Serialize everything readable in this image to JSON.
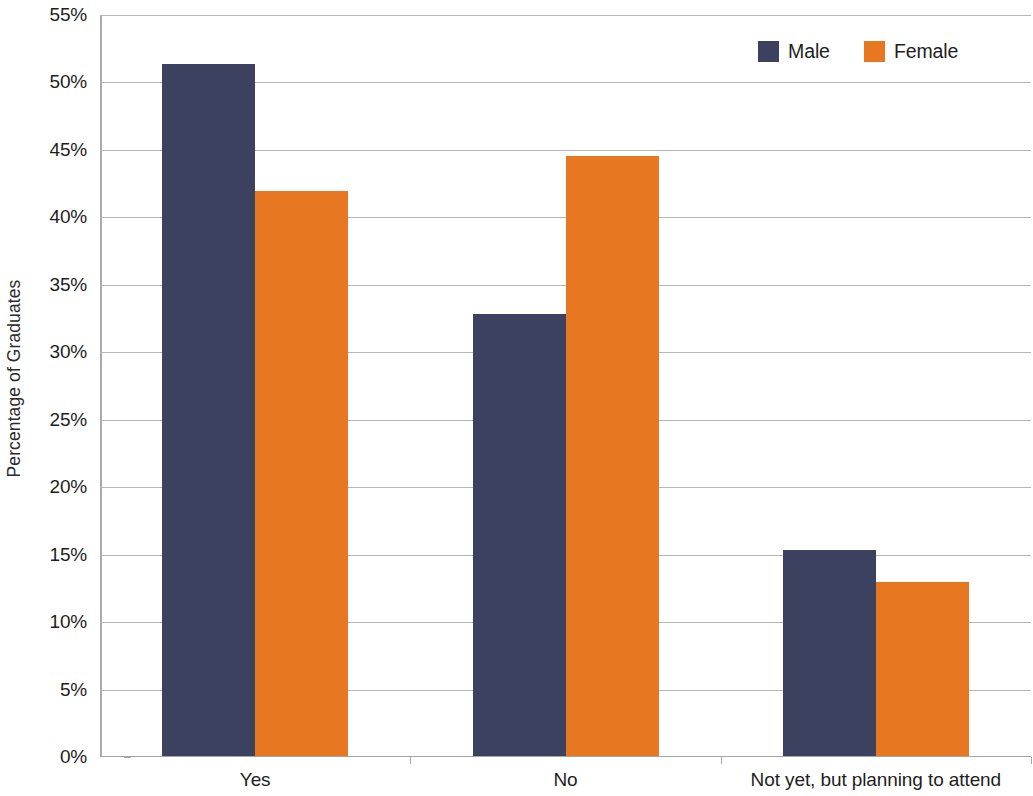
{
  "chart_data": {
    "type": "bar",
    "title": "",
    "subtitle": "",
    "xlabel": "",
    "ylabel": "Percentage of Graduates",
    "categories": [
      "Yes",
      "No",
      "Not yet, but planning to attend"
    ],
    "series": [
      {
        "name": "Male",
        "color": "#3d4160",
        "values": [
          51.3,
          32.8,
          15.3
        ]
      },
      {
        "name": "Female",
        "color": "#e87722",
        "values": [
          41.9,
          44.5,
          12.9
        ]
      }
    ],
    "ylim": [
      0,
      55
    ],
    "ytick_step": 5,
    "ytick_labels": [
      "0%",
      "5%",
      "10%",
      "15%",
      "20%",
      "25%",
      "30%",
      "35%",
      "40%",
      "45%",
      "50%",
      "55%"
    ],
    "ytick_values": [
      0,
      5,
      10,
      15,
      20,
      25,
      30,
      35,
      40,
      45,
      50,
      55
    ],
    "value_format": "percent",
    "grid": true,
    "grid_axis": "y",
    "legend": true,
    "legend_position": "top-right",
    "bar_gap_within_group": 0,
    "data_labels": false
  },
  "legend": {
    "items": [
      {
        "label": "Male",
        "color": "#3d4160"
      },
      {
        "label": "Female",
        "color": "#e87722"
      }
    ]
  },
  "axes": {
    "y_title": "Percentage of Graduates"
  },
  "colors": {
    "male": "#3d4160",
    "female": "#e87722",
    "gridline": "#b6b6b6",
    "axis": "#a6a6a6",
    "background": "#ffffff",
    "text": "#1e1e1e"
  }
}
